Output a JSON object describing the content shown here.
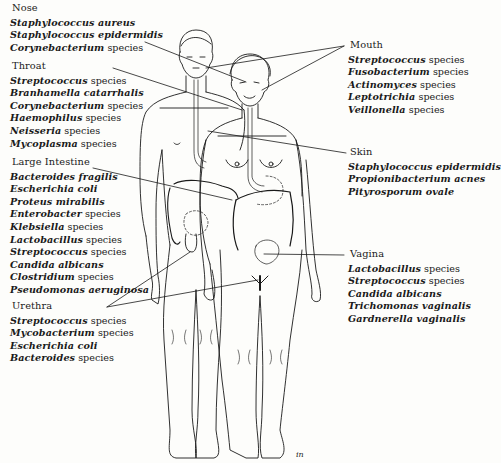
{
  "figure": {
    "illustration": "Front view of male and female figures with digestive, urinary and reproductive tracts outlined",
    "signature": "in"
  },
  "regions": {
    "nose": {
      "label": "Nose",
      "items": [
        {
          "genus": "Staphylococcus aureus",
          "suffix": ""
        },
        {
          "genus": "Staphylococcus epidermidis",
          "suffix": ""
        },
        {
          "genus": "Corynebacterium",
          "suffix": " species"
        }
      ]
    },
    "throat": {
      "label": "Throat",
      "items": [
        {
          "genus": "Streptococcus",
          "suffix": " species"
        },
        {
          "genus": "Branhamella catarrhalis",
          "suffix": ""
        },
        {
          "genus": "Corynebacterium",
          "suffix": " species"
        },
        {
          "genus": "Haemophilus",
          "suffix": " species"
        },
        {
          "genus": "Neisseria",
          "suffix": " species"
        },
        {
          "genus": "Mycoplasma",
          "suffix": " species"
        }
      ]
    },
    "large_intestine": {
      "label": "Large Intestine",
      "items": [
        {
          "genus": "Bacteroides fragilis",
          "suffix": ""
        },
        {
          "genus": "Escherichia coli",
          "suffix": ""
        },
        {
          "genus": "Proteus mirabilis",
          "suffix": ""
        },
        {
          "genus": "Enterobacter",
          "suffix": " species"
        },
        {
          "genus": "Klebsiella",
          "suffix": " species"
        },
        {
          "genus": "Lactobacillus",
          "suffix": " species"
        },
        {
          "genus": "Streptococcus",
          "suffix": " species"
        },
        {
          "genus": "Candida albicans",
          "suffix": ""
        },
        {
          "genus": "Clostridium",
          "suffix": " species"
        },
        {
          "genus": "Pseudomonas aeruginosa",
          "suffix": ""
        }
      ]
    },
    "urethra": {
      "label": "Urethra",
      "items": [
        {
          "genus": "Streptococcus",
          "suffix": " species"
        },
        {
          "genus": "Mycobacterium",
          "suffix": " species"
        },
        {
          "genus": "Escherichia coli",
          "suffix": ""
        },
        {
          "genus": "Bacteroides",
          "suffix": " species"
        }
      ]
    },
    "mouth": {
      "label": "Mouth",
      "items": [
        {
          "genus": "Streptococcus",
          "suffix": " species"
        },
        {
          "genus": "Fusobacterium",
          "suffix": " species"
        },
        {
          "genus": "Actinomyces",
          "suffix": " species"
        },
        {
          "genus": "Leptotrichia",
          "suffix": " species"
        },
        {
          "genus": "Veillonella",
          "suffix": " species"
        }
      ]
    },
    "skin": {
      "label": "Skin",
      "items": [
        {
          "genus": "Staphylococcus epidermidis",
          "suffix": ""
        },
        {
          "genus": "Propionibacterium acnes",
          "suffix": ""
        },
        {
          "genus": "Pityrosporum ovale",
          "suffix": ""
        }
      ]
    },
    "vagina": {
      "label": "Vagina",
      "items": [
        {
          "genus": "Lactobacillus",
          "suffix": " species"
        },
        {
          "genus": "Streptococcus",
          "suffix": " species"
        },
        {
          "genus": "Candida albicans",
          "suffix": ""
        },
        {
          "genus": "Trichomonas vaginalis",
          "suffix": ""
        },
        {
          "genus": "Gardnerella vaginalis",
          "suffix": ""
        }
      ]
    }
  },
  "colors": {
    "ink": "#1a1a1a",
    "paper": "#fdfdfb"
  }
}
